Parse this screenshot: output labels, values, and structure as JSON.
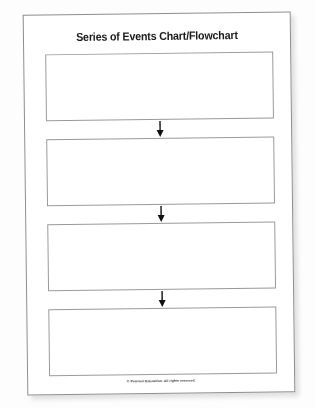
{
  "document": {
    "title": "Series of Events Chart/Flowchart",
    "footer": "© Pearson Education. All rights reserved.",
    "colors": {
      "page_background": "#ffffff",
      "canvas_background": "#fdfdfd",
      "box_border": "#9a9a9a",
      "page_border": "#8e8e8e",
      "text": "#1a1a1a",
      "arrow": "#111111"
    },
    "flow": {
      "box_count": 4,
      "boxes": [
        {
          "label": "",
          "placeholder": ""
        },
        {
          "label": "",
          "placeholder": ""
        },
        {
          "label": "",
          "placeholder": ""
        },
        {
          "label": "",
          "placeholder": ""
        }
      ],
      "connectors": [
        {
          "icon": "arrow-down-icon"
        },
        {
          "icon": "arrow-down-icon"
        },
        {
          "icon": "arrow-down-icon"
        }
      ]
    }
  }
}
